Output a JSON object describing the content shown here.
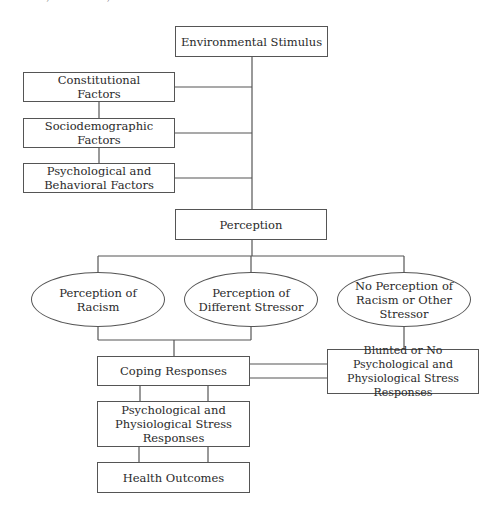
{
  "page_header": "122 RACE, ETHNICITY, AND HEALTH",
  "diagram": {
    "nodes": {
      "environmental_stimulus": "Environmental Stimulus",
      "constitutional_factors": "Constitutional Factors",
      "sociodemographic_factors": "Sociodemographic Factors",
      "psych_behavioral_factors": "Psychological and Behavioral Factors",
      "perception": "Perception",
      "perception_of_racism": "Perception of Racism",
      "perception_of_different_stressor": "Perception of Different Stressor",
      "no_perception": "No Perception of Racism or Other Stressor",
      "coping_responses": "Coping Responses",
      "blunted_responses": "Blunted or No Psychological and Physiological Stress Responses",
      "stress_responses": "Psychological and Physiological Stress Responses",
      "health_outcomes": "Health Outcomes"
    },
    "line_color": "#555555"
  }
}
